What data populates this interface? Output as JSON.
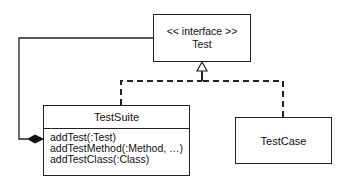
{
  "diagram": {
    "type": "uml-class-diagram",
    "interface": {
      "stereotype": "<< interface >>",
      "name": "Test"
    },
    "classes": [
      {
        "name": "TestSuite",
        "operations": [
          "addTest(:Test)",
          "addTestMethod(:Method, …)",
          "addTestClass(:Class)"
        ]
      },
      {
        "name": "TestCase",
        "operations": []
      }
    ],
    "relationships": [
      {
        "kind": "realization",
        "from": "TestSuite",
        "to": "Test",
        "style": "dashed",
        "arrow": "hollow-triangle"
      },
      {
        "kind": "realization",
        "from": "TestCase",
        "to": "Test",
        "style": "dashed",
        "arrow": "hollow-triangle"
      },
      {
        "kind": "composition",
        "whole": "TestSuite",
        "part": "Test",
        "end": "filled-diamond"
      }
    ]
  },
  "colors": {
    "line": "#222222",
    "background": "#ffffff",
    "text": "#111111"
  }
}
